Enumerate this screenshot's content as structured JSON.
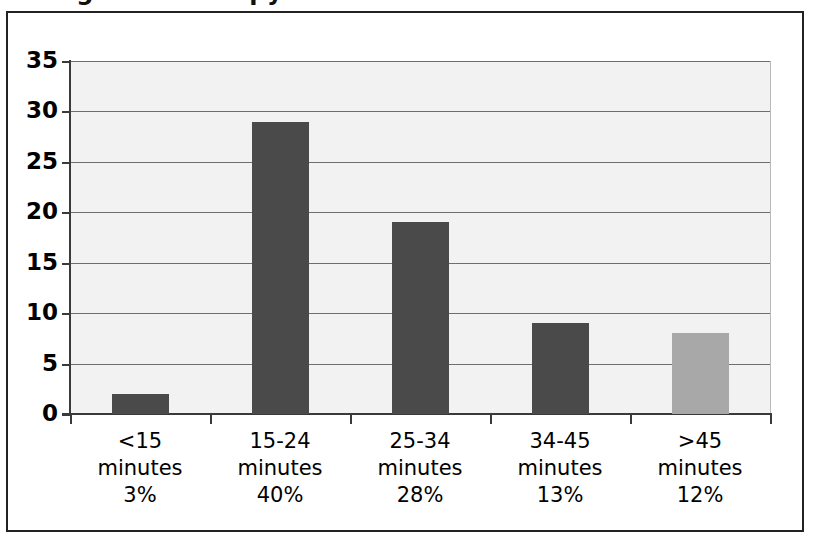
{
  "figure": {
    "title": "Length of Therapy Sessions",
    "title_clipped": true
  },
  "chart_data": {
    "type": "bar",
    "title": "Length of Therapy Sessions",
    "xlabel": "",
    "ylabel": "",
    "categories": [
      "<15 minutes",
      "15-24 minutes",
      "25-34 minutes",
      "34-45 minutes",
      ">45 minutes"
    ],
    "category_lines": [
      [
        "<15",
        "minutes",
        "3%"
      ],
      [
        "15-24",
        "minutes",
        "40%"
      ],
      [
        "25-34",
        "minutes",
        "28%"
      ],
      [
        "34-45",
        "minutes",
        "13%"
      ],
      [
        ">45",
        "minutes",
        "12%"
      ]
    ],
    "values": [
      2,
      29,
      19,
      9,
      8
    ],
    "percent_labels": [
      "3%",
      "40%",
      "28%",
      "13%",
      "12%"
    ],
    "bar_colors": [
      "#4a4a4a",
      "#4a4a4a",
      "#4a4a4a",
      "#4a4a4a",
      "#a8a8a8"
    ],
    "ylim": [
      0,
      35
    ],
    "ytick_values": [
      "35",
      "30",
      "25",
      "20",
      "15",
      "10",
      "5",
      "0"
    ],
    "grid": true,
    "legend": "none",
    "plot_background": "#f2f2f2",
    "gridline_color": "#6e6e6e",
    "axis_color": "#3a3a3a"
  }
}
